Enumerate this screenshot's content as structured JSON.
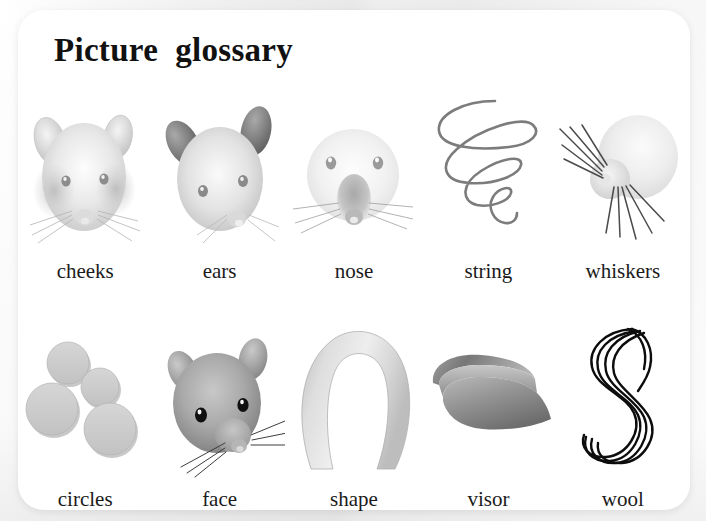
{
  "page": {
    "title": "Picture  glossary",
    "background_color": "#f2f2f2",
    "card_color": "#ffffff",
    "text_color": "#1b1b1b"
  },
  "rows": [
    {
      "items": [
        {
          "label": "cheeks",
          "icon": "mouse-head-cheeks-image"
        },
        {
          "label": "ears",
          "icon": "mouse-head-ears-image"
        },
        {
          "label": "nose",
          "icon": "mouse-head-nose-image"
        },
        {
          "label": "string",
          "icon": "squiggly-string-image"
        },
        {
          "label": "whiskers",
          "icon": "mouse-whiskers-image"
        }
      ]
    },
    {
      "items": [
        {
          "label": "circles",
          "icon": "four-gray-circles-image"
        },
        {
          "label": "face",
          "icon": "mouse-face-image"
        },
        {
          "label": "shape",
          "icon": "horseshoe-arch-shape-image"
        },
        {
          "label": "visor",
          "icon": "sun-visor-image"
        },
        {
          "label": "wool",
          "icon": "coiled-wool-yarn-image"
        }
      ]
    }
  ]
}
